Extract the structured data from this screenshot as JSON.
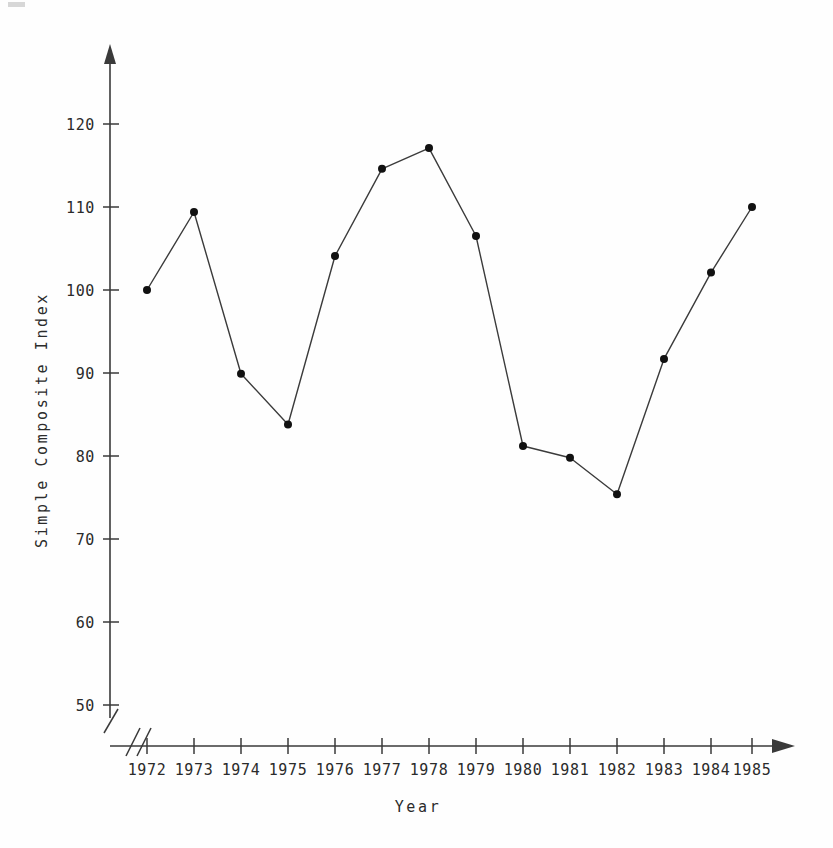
{
  "chart_data": {
    "type": "line",
    "title": "",
    "xlabel": "Year",
    "ylabel": "Simple Composite Index",
    "categories": [
      "1972",
      "1973",
      "1974",
      "1975",
      "1976",
      "1977",
      "1978",
      "1979",
      "1980",
      "1981",
      "1982",
      "1983",
      "1984",
      "1985"
    ],
    "x": [
      1972,
      1973,
      1974,
      1975,
      1976,
      1977,
      1978,
      1979,
      1980,
      1981,
      1982,
      1983,
      1984,
      1985
    ],
    "values": [
      100.0,
      109.4,
      89.9,
      83.8,
      104.1,
      114.6,
      117.1,
      106.5,
      81.2,
      79.8,
      75.4,
      91.7,
      102.1,
      110.0
    ],
    "series": [
      {
        "name": "Simple Composite Index",
        "values": [
          100.0,
          109.4,
          89.9,
          83.8,
          104.1,
          114.6,
          117.1,
          106.5,
          81.2,
          79.8,
          75.4,
          91.7,
          102.1,
          110.0
        ]
      }
    ],
    "ylim": [
      50,
      125
    ],
    "yticks": [
      50,
      60,
      70,
      80,
      90,
      100,
      110,
      120
    ],
    "ytick_labels": [
      "50",
      "60",
      "70",
      "80",
      "90",
      "100",
      "110",
      "120"
    ],
    "xtick_labels": [
      "1972",
      "1973",
      "1974",
      "1975",
      "1976",
      "1977",
      "1978",
      "1979",
      "1980",
      "1981",
      "1982",
      "1983",
      "1984",
      "1985"
    ],
    "grid": false,
    "legend": "none",
    "axis_break_x": true,
    "axis_break_y": true,
    "marker": "filled-circle",
    "line_color": "#3b3b3b",
    "marker_color": "#111111",
    "axis_color": "#3a3a3a",
    "background_color": "#fefefe"
  },
  "axes": {
    "y_title": "Simple Composite Index",
    "x_title": "Year"
  },
  "ticks": {
    "y": [
      {
        "label": "120",
        "value": 120
      },
      {
        "label": "110",
        "value": 110
      },
      {
        "label": "100",
        "value": 100
      },
      {
        "label": "90",
        "value": 90
      },
      {
        "label": "80",
        "value": 80
      },
      {
        "label": "70",
        "value": 70
      },
      {
        "label": "60",
        "value": 60
      },
      {
        "label": "50",
        "value": 50
      }
    ],
    "x": [
      {
        "label": "1972"
      },
      {
        "label": "1973"
      },
      {
        "label": "1974"
      },
      {
        "label": "1975"
      },
      {
        "label": "1976"
      },
      {
        "label": "1977"
      },
      {
        "label": "1978"
      },
      {
        "label": "1979"
      },
      {
        "label": "1980"
      },
      {
        "label": "1981"
      },
      {
        "label": "1982"
      },
      {
        "label": "1983"
      },
      {
        "label": "1984"
      },
      {
        "label": "1985"
      }
    ]
  }
}
